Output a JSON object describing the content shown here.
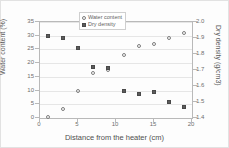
{
  "chart_data": {
    "type": "scatter",
    "title": "",
    "xlabel": "Distance from the heater (cm)",
    "ylabel": "Water content (%)",
    "y2label": "Dry density (g/cm3)",
    "xlim": [
      0,
      20
    ],
    "ylim": [
      0,
      35
    ],
    "y2lim": [
      1.4,
      2.0
    ],
    "xticks": [
      "0",
      "5",
      "10",
      "15",
      "20"
    ],
    "xtick_values": [
      0,
      5,
      10,
      15,
      20
    ],
    "yticks": [
      "0",
      "5",
      "10",
      "15",
      "20",
      "25",
      "30",
      "35"
    ],
    "ytick_values": [
      0,
      5,
      10,
      15,
      20,
      25,
      30,
      35
    ],
    "y2ticks": [
      "1.4",
      "1.5",
      "1.6",
      "1.7",
      "1.8",
      "1.9",
      "2.0"
    ],
    "y2tick_values": [
      1.4,
      1.5,
      1.6,
      1.7,
      1.8,
      1.9,
      2.0
    ],
    "grid": "horizontal",
    "legend_position": "top-center",
    "x": [
      1,
      3,
      5,
      7,
      9,
      11,
      13,
      15,
      17,
      19
    ],
    "series": [
      {
        "name": "Water content",
        "axis": "left",
        "marker": "open-circle",
        "color": "#7e7e7e",
        "values": [
          0.3,
          3.2,
          10.0,
          16.3,
          17.4,
          22.8,
          26.3,
          27.1,
          29.2,
          30.9
        ]
      },
      {
        "name": "Dry density",
        "axis": "right",
        "marker": "filled-square",
        "color": "#5c5c5c",
        "values": [
          1.91,
          1.9,
          1.84,
          1.72,
          1.71,
          1.57,
          1.55,
          1.56,
          1.5,
          1.47
        ]
      }
    ]
  },
  "legend": {
    "items": [
      {
        "label": "Water content",
        "marker": "open-circle"
      },
      {
        "label": "Dry density",
        "marker": "filled-square"
      }
    ]
  }
}
